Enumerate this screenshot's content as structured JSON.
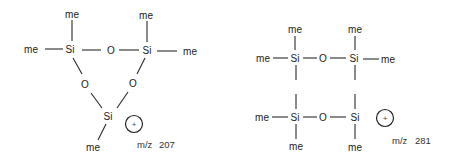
{
  "diagram": {
    "left_structure": {
      "description": "cyclic trisiloxane fragment ion",
      "atoms": {
        "si_top_left": "Si",
        "si_top_right": "Si",
        "si_bottom": "Si",
        "o_top": "O",
        "o_left": "O",
        "o_right": "O",
        "me_si1_top": "me",
        "me_si1_left": "me",
        "me_si2_top": "me",
        "me_si2_right": "me",
        "me_si3_bottom": "me"
      },
      "charge": "+",
      "mz_label": "m/z",
      "mz_value": "207"
    },
    "right_structure": {
      "description": "cyclic tetrasiloxane fragment ion",
      "atoms": {
        "si_top_left": "Si",
        "si_top_right": "Si",
        "si_bottom_left": "Si",
        "si_bottom_right": "Si",
        "o_top": "O",
        "o_bottom": "O",
        "me_tl_top": "me",
        "me_tl_left": "me",
        "me_tr_top": "me",
        "me_tr_right": "me",
        "me_bl_left": "me",
        "me_bl_bottom": "me",
        "me_br_bottom": "me"
      },
      "charge": "+",
      "mz_label": "m/z",
      "mz_value": "281"
    }
  }
}
